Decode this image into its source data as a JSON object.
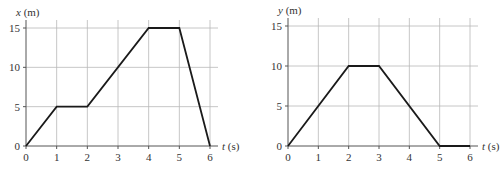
{
  "chart_data": [
    {
      "type": "line",
      "title": "",
      "xlabel": "t (s)",
      "xlabel_var": "t",
      "xlabel_unit": "(s)",
      "ylabel": "x (m)",
      "ylabel_var": "x",
      "ylabel_unit": "(m)",
      "x_ticks": [
        0,
        1,
        2,
        3,
        4,
        5,
        6
      ],
      "y_ticks": [
        0,
        5,
        10,
        15
      ],
      "xlim": [
        0,
        6
      ],
      "ylim": [
        0,
        15
      ],
      "grid": true,
      "legend": null,
      "series": [
        {
          "name": "x(t)",
          "x": [
            0,
            1,
            2,
            4,
            5,
            6
          ],
          "y": [
            0,
            5,
            5,
            15,
            15,
            0
          ]
        }
      ]
    },
    {
      "type": "line",
      "title": "",
      "xlabel": "t (s)",
      "xlabel_var": "t",
      "xlabel_unit": "(s)",
      "ylabel": "y (m)",
      "ylabel_var": "y",
      "ylabel_unit": "(m)",
      "x_ticks": [
        0,
        1,
        2,
        3,
        4,
        5,
        6
      ],
      "y_ticks": [
        0,
        5,
        10,
        15
      ],
      "xlim": [
        0,
        6
      ],
      "ylim": [
        0,
        15
      ],
      "grid": true,
      "legend": null,
      "series": [
        {
          "name": "y(t)",
          "x": [
            0,
            2,
            3,
            5,
            6
          ],
          "y": [
            0,
            10,
            10,
            0,
            0
          ]
        }
      ]
    }
  ],
  "colors": {
    "line": "#1a1a1a",
    "grid": "#b8b8b8",
    "axis": "#555555",
    "text": "#333333"
  }
}
